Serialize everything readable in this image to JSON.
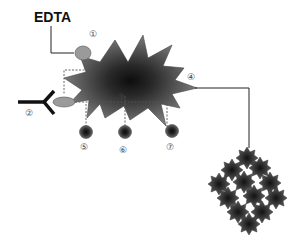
{
  "diagram": {
    "title_label": "EDTA",
    "markers": [
      {
        "id": "1",
        "glyph": "①",
        "description": "ligand bound to EDTA on cell surface"
      },
      {
        "id": "2",
        "glyph": "②",
        "description": "antibody"
      },
      {
        "id": "3",
        "glyph": "③",
        "description": "cell center"
      },
      {
        "id": "4",
        "glyph": "④",
        "description": "linker to cell cluster"
      },
      {
        "id": "5",
        "glyph": "⑤",
        "description": "bead"
      },
      {
        "id": "6",
        "glyph": "⑥",
        "description": "bead"
      },
      {
        "id": "7",
        "glyph": "⑦",
        "description": "bead"
      }
    ],
    "colors": {
      "cell_fill_outer": "#7a7a7a",
      "cell_fill_center": "#0d0d0d",
      "oval_fill": "#9a9a9a",
      "bead_fill": "#2a2a2a",
      "line": "#222222",
      "dashed": "#555555"
    }
  }
}
